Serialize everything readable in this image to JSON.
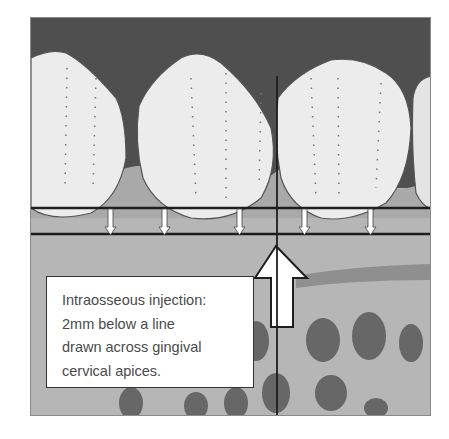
{
  "figure": {
    "caption_lines": [
      "Intraosseous injection:",
      "2mm below a line",
      "drawn across gingival",
      "cervical apices."
    ],
    "colors": {
      "gingiva_dark": "#4d4d4d",
      "tooth_crown": "#ececec",
      "bone": "#b4b4b4",
      "line": "#1e1e1e",
      "arrow_fill": "#ffffff"
    },
    "elements": {
      "teeth_count": 4,
      "small_arrows_count": 5,
      "upper_reference_line": "gingival cervical line",
      "lower_reference_line": "2mm below line",
      "large_arrow": "injection site indicator",
      "vertical_line": "tooth axis line"
    }
  }
}
